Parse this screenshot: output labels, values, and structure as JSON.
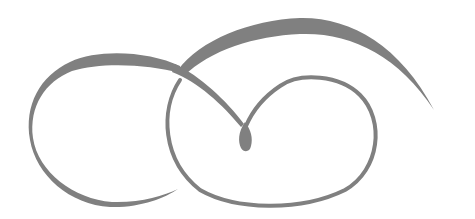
{
  "image": {
    "description": "Decorative calligraphic swirl flourish with two interlocking loops and a teardrop center",
    "background_color": "#ffffff",
    "stroke_color": "#808080"
  }
}
